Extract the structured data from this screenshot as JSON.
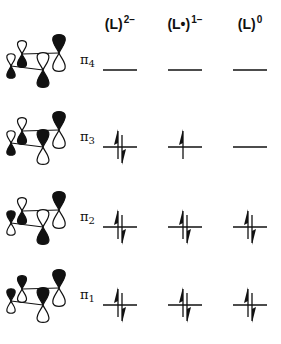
{
  "columns": [
    {
      "label": "(L)",
      "charge": "2−",
      "center_x": 120
    },
    {
      "label": "(L•)",
      "charge": "1−",
      "center_x": 185
    },
    {
      "label": "(L)",
      "charge": "0",
      "center_x": 250
    }
  ],
  "orbitals": [
    {
      "name": "π",
      "index": "4",
      "level_y": 70,
      "occupancy": [
        0,
        0,
        0
      ],
      "lobes": [
        "down-filled",
        "down-filled",
        "down-filled",
        "up-filled"
      ]
    },
    {
      "name": "π",
      "index": "3",
      "level_y": 147,
      "occupancy": [
        2,
        1,
        0
      ],
      "lobes": [
        "down-filled",
        "down-filled",
        "up-filled",
        "up-filled"
      ]
    },
    {
      "name": "π",
      "index": "2",
      "level_y": 227,
      "occupancy": [
        2,
        2,
        2
      ],
      "lobes": [
        "down-filled",
        "up-filled",
        "down-filled",
        "up-filled"
      ]
    },
    {
      "name": "π",
      "index": "1",
      "level_y": 305,
      "occupancy": [
        2,
        2,
        2
      ],
      "lobes": [
        "up-filled",
        "up-filled",
        "up-filled",
        "up-filled"
      ]
    }
  ],
  "colors": {
    "ink": "#111111",
    "background": "#ffffff"
  }
}
